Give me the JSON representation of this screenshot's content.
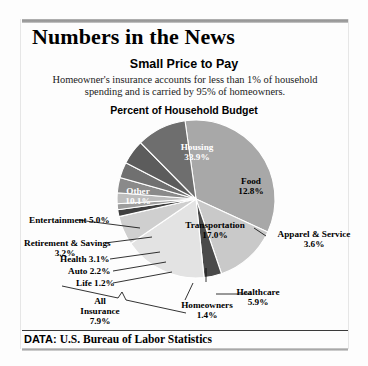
{
  "masthead": "Numbers in the News",
  "subtitle": "Small Price to Pay",
  "description": "Homeowner's insurance accounts for less than 1% of household spending and is carried by 95% of homeowners.",
  "chart_title": "Percent of Household Budget",
  "footer": {
    "prefix": "DATA:",
    "source": "U.S. Bureau of Labor Statistics"
  },
  "labels": {
    "housing_name": "Housing",
    "housing_value": "33.9%",
    "food_name": "Food",
    "food_value": "12.8%",
    "apparel_name": "Apparel & Service",
    "apparel_value": "3.6%",
    "transportation_name": "Transportation",
    "transportation_value": "17.0%",
    "healthcare_name": "Healthcare",
    "healthcare_value": "5.9%",
    "homeowners_name": "Homeowners",
    "homeowners_value": "1.4%",
    "life_name": "Life 1.2%",
    "auto_name": "Auto 2.2%",
    "health_name": "Health 3.1%",
    "retirement_name": "Retirement & Savings",
    "retirement_value": "3.2%",
    "entertainment_name": "Entertainment 5.0%",
    "other_name": "Other",
    "other_value": "10.1%",
    "allins_line1": "All",
    "allins_line2": "Insurance",
    "allins_line3": "7.9%"
  },
  "chart_data": {
    "type": "pie",
    "title": "Percent of Household Budget",
    "unit": "percent",
    "start_angle_deg": -8,
    "direction": "clockwise",
    "categories": [
      "Housing",
      "Food",
      "Apparel & Service",
      "Transportation",
      "Healthcare",
      "Homeowners",
      "Life",
      "Auto",
      "Health",
      "Retirement & Savings",
      "Entertainment",
      "Other"
    ],
    "values": [
      33.9,
      12.8,
      3.6,
      17.0,
      5.9,
      1.4,
      1.2,
      2.2,
      3.1,
      3.2,
      5.0,
      10.1
    ],
    "colors": [
      "#a8a8a8",
      "#c9c9c9",
      "#4a4a4a",
      "#e3e3e3",
      "#cfcfcf",
      "#3f3f3f",
      "#9d9d9d",
      "#bdbdbd",
      "#8a8a8a",
      "#707070",
      "#5c5c5c",
      "#6e6e6e"
    ],
    "grouped_annotation": {
      "label": "All Insurance",
      "value": "7.9%",
      "members": [
        "Health",
        "Auto",
        "Life",
        "Homeowners"
      ]
    },
    "legend": "none (direct labels with leader lines)"
  }
}
